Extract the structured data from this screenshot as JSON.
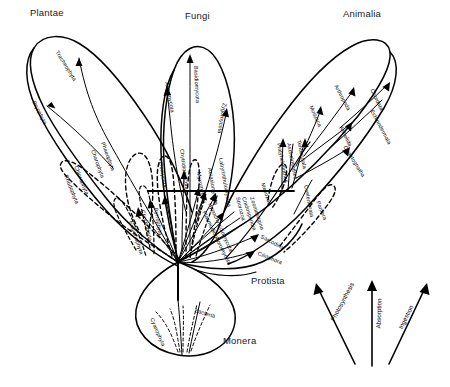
{
  "diagram": {
    "title_present": false,
    "kingdoms": [
      {
        "name": "Plantae",
        "x": 30,
        "y": 13
      },
      {
        "name": "Fungi",
        "x": 185,
        "y": 16
      },
      {
        "name": "Animalia",
        "x": 343,
        "y": 14
      },
      {
        "name": "Protista",
        "x": 251,
        "y": 280
      },
      {
        "name": "Monera",
        "x": 223,
        "y": 341
      }
    ],
    "phyla": {
      "plantae": [
        {
          "name": "Tracheophyta",
          "x": 57,
          "y": 48,
          "rot": 58
        },
        {
          "name": "Bryophyta",
          "x": 34,
          "y": 98,
          "rot": 63
        },
        {
          "name": "Phaeophyta",
          "x": 103,
          "y": 139,
          "rot": 70
        },
        {
          "name": "Charophyta",
          "x": 93,
          "y": 147,
          "rot": 70
        },
        {
          "name": "Chlorophyta",
          "x": 76,
          "y": 163,
          "rot": 68
        },
        {
          "name": "Rhodophyta",
          "x": 66,
          "y": 172,
          "rot": 68
        }
      ],
      "fungi": [
        {
          "name": "Ascomycota",
          "x": 167,
          "y": 79,
          "rot": 79
        },
        {
          "name": "Basidiomycota",
          "x": 196,
          "y": 63,
          "rot": 87
        },
        {
          "name": "Zygomycota",
          "x": 225,
          "y": 100,
          "rot": 100
        },
        {
          "name": "Oomycota",
          "x": 161,
          "y": 159,
          "rot": 81
        },
        {
          "name": "Chytridiomycota",
          "x": 182,
          "y": 146,
          "rot": 83
        }
      ],
      "protista": [
        {
          "name": "Euglenophyta",
          "x": 131,
          "y": 218,
          "rot": 72
        },
        {
          "name": "Chrysophyta",
          "x": 143,
          "y": 207,
          "rot": 76
        },
        {
          "name": "Pyrrophyta",
          "x": 156,
          "y": 205,
          "rot": 80
        },
        {
          "name": "Myxomycota",
          "x": 199,
          "y": 169,
          "rot": 80
        },
        {
          "name": "Acrasiomycota",
          "x": 210,
          "y": 165,
          "rot": 80
        },
        {
          "name": "Labyrinthulomycota",
          "x": 221,
          "y": 155,
          "rot": 80
        },
        {
          "name": "Hypochytridiomycota",
          "x": 210,
          "y": 200,
          "rot": 66
        },
        {
          "name": "Plasmodiophoromycota",
          "x": 204,
          "y": 208,
          "rot": 64
        },
        {
          "name": "Sporozoa",
          "x": 238,
          "y": 194,
          "rot": 76
        },
        {
          "name": "Cnidosporidia",
          "x": 244,
          "y": 194,
          "rot": 72
        },
        {
          "name": "Zoomastigina",
          "x": 252,
          "y": 194,
          "rot": 72
        },
        {
          "name": "Sarcodina",
          "x": 261,
          "y": 233,
          "rot": 28
        },
        {
          "name": "Ciliophora",
          "x": 258,
          "y": 250,
          "rot": 22
        },
        {
          "name": "Mesozoa",
          "x": 263,
          "y": 180,
          "rot": 72
        }
      ],
      "animalia": [
        {
          "name": "Mollusca",
          "x": 311,
          "y": 103,
          "rot": 65
        },
        {
          "name": "Arthropoda",
          "x": 336,
          "y": 82,
          "rot": 62
        },
        {
          "name": "Chordata",
          "x": 372,
          "y": 86,
          "rot": 64
        },
        {
          "name": "Annelida",
          "x": 341,
          "y": 123,
          "rot": 64
        },
        {
          "name": "Echinodermata",
          "x": 372,
          "y": 107,
          "rot": 62
        },
        {
          "name": "Chaetognatha",
          "x": 345,
          "y": 143,
          "rot": 58
        },
        {
          "name": "Tentaculata",
          "x": 299,
          "y": 137,
          "rot": 78
        },
        {
          "name": "Aschelminthes",
          "x": 289,
          "y": 140,
          "rot": 79
        },
        {
          "name": "Platyhelminthes",
          "x": 279,
          "y": 140,
          "rot": 79
        },
        {
          "name": "Coelenterata",
          "x": 306,
          "y": 182,
          "rot": 79
        },
        {
          "name": "Porifera",
          "x": 318,
          "y": 198,
          "rot": 68
        }
      ],
      "monera": [
        {
          "name": "Cyanophyta",
          "x": 152,
          "y": 315,
          "rot": 67
        },
        {
          "name": "Bacteria",
          "x": 195,
          "y": 307,
          "rot": 17
        }
      ]
    },
    "legend": {
      "items": [
        {
          "name": "Photosynthesis",
          "x": 332,
          "y": 317,
          "rot": -62
        },
        {
          "name": "Absorption",
          "x": 378,
          "y": 325,
          "rot": -88
        },
        {
          "name": "Ingestion",
          "x": 400,
          "y": 325,
          "rot": -64
        }
      ]
    },
    "colors": {
      "line": "#000000",
      "background": "#ffffff",
      "text": "#000000"
    }
  }
}
